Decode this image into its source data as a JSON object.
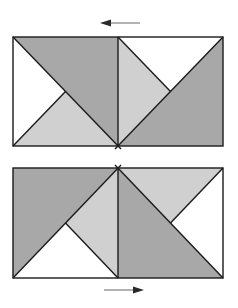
{
  "colors": {
    "dark": "#a8a8a8",
    "light": "#d0d0d0",
    "white": "#ffffff",
    "stroke": "#1a1a1a",
    "arrow": "#2a2a2a",
    "arrow_shaft": "#9a9a9a"
  },
  "top_figure": {
    "arrow_direction": "left",
    "frame": {
      "x": 13,
      "y": 37,
      "width": 210,
      "height": 109
    },
    "regions": [
      {
        "name": "top-left-dark",
        "fill": "dark"
      },
      {
        "name": "top-left-white",
        "fill": "white"
      },
      {
        "name": "top-left-light",
        "fill": "light"
      },
      {
        "name": "top-right-white",
        "fill": "white"
      },
      {
        "name": "top-right-light",
        "fill": "light"
      },
      {
        "name": "top-right-dark",
        "fill": "dark"
      }
    ]
  },
  "bottom_figure": {
    "arrow_direction": "right",
    "frame": {
      "x": 13,
      "y": 168,
      "width": 210,
      "height": 110
    },
    "regions": [
      {
        "name": "bottom-left-dark",
        "fill": "dark"
      },
      {
        "name": "bottom-left-light",
        "fill": "light"
      },
      {
        "name": "bottom-left-white",
        "fill": "white"
      },
      {
        "name": "bottom-right-light",
        "fill": "light"
      },
      {
        "name": "bottom-right-white",
        "fill": "white"
      },
      {
        "name": "bottom-right-dark",
        "fill": "dark"
      }
    ]
  }
}
